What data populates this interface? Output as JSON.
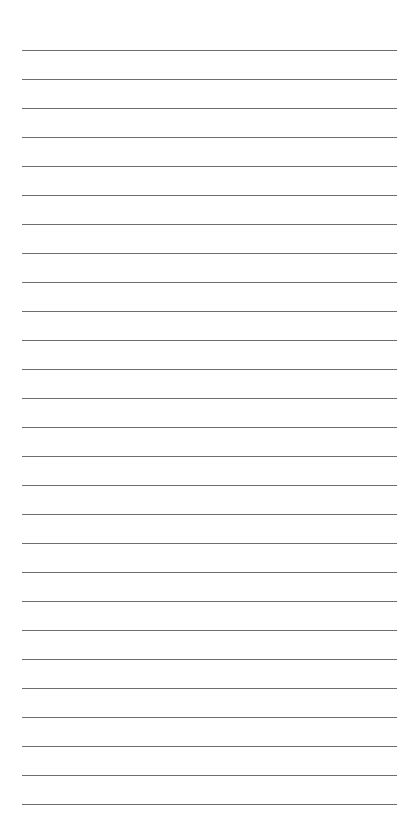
{
  "page": {
    "type": "lined-paper",
    "background_color": "#ffffff",
    "line_color": "#6e6e6e",
    "line_count": 27,
    "first_line_y": 50,
    "line_spacing": 29,
    "line_left": 22,
    "line_width": 375
  }
}
